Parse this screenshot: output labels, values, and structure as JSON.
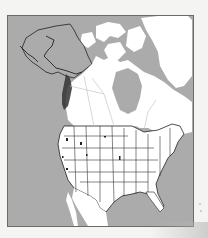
{
  "map": {
    "title": "North America political outline map",
    "subject": "Highlighted Pacific Northwest coastal range (Alaska panhandle to Oregon/California coast)",
    "regions_shown": [
      "Alaska",
      "Canada",
      "Greenland",
      "United States (contiguous)",
      "Mexico (north)"
    ],
    "colors": {
      "ocean": "#ababab",
      "land": "#ffffff",
      "borders": "#333333",
      "highlight": "#333333",
      "frame": "#6a6a6a",
      "background": "#f4f4f2"
    },
    "legend": null
  }
}
